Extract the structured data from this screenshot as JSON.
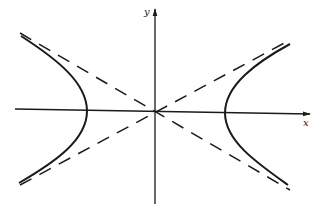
{
  "diagram": {
    "type": "hyperbola with asymptotes",
    "axes": {
      "x_label": "x",
      "y_label": "y"
    },
    "curve": {
      "description": "Hyperbola opening left and right (solid)",
      "branches": [
        "left",
        "right"
      ]
    },
    "asymptotes": {
      "description": "Two dashed lines crossing at the origin",
      "style": "dashed"
    },
    "colors": {
      "stroke": "#1a1a1a",
      "background": "#ffffff"
    }
  }
}
